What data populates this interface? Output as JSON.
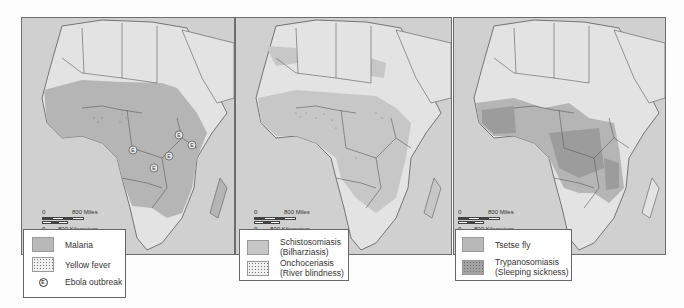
{
  "panels": [
    {
      "id": "malaria-map",
      "scale": {
        "miles_zero": "0",
        "miles_label": "800 Miles",
        "km_zero": "0",
        "km_label": "800 Kilometers"
      },
      "legend": [
        {
          "symbol": "solid-gray",
          "label": "Malaria"
        },
        {
          "symbol": "dot-pattern",
          "label": "Yellow fever"
        },
        {
          "symbol": "circled-E",
          "glyph": "E",
          "label": "Ebola outbreak"
        }
      ],
      "ebola_markers": [
        "E",
        "E",
        "E",
        "E",
        "E"
      ]
    },
    {
      "id": "schistosomiasis-map",
      "scale": {
        "miles_zero": "0",
        "miles_label": "800 Miles",
        "km_zero": "0",
        "km_label": "800 Kilometers"
      },
      "legend": [
        {
          "symbol": "solid-light-gray",
          "label": "Schistosomiasis",
          "sublabel": "(Bilharziasis)"
        },
        {
          "symbol": "dot-pattern",
          "label": "Onchoceriasis",
          "sublabel": "(River blindness)"
        }
      ]
    },
    {
      "id": "tsetse-map",
      "scale": {
        "miles_zero": "0",
        "miles_label": "800 Miles",
        "km_zero": "0",
        "km_label": "800 Kilometers"
      },
      "legend": [
        {
          "symbol": "solid-gray",
          "label": "Tsetse fly"
        },
        {
          "symbol": "dark-dot-pattern",
          "label": "Trypanosomiasis",
          "sublabel": "(Sleeping sickness)"
        }
      ]
    }
  ],
  "colors": {
    "ocean": "#cfd0cf",
    "land": "#e3e3e3",
    "disease_fill": "#b5b5b5",
    "disease_dark": "#9c9c9c",
    "border": "#5a5a5a"
  }
}
